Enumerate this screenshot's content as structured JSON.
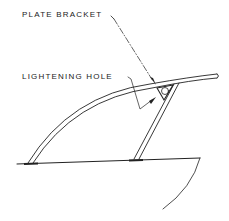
{
  "diagram": {
    "labels": {
      "plate_bracket": "PLATE BRACKET",
      "lightening_hole": "LIGHTENING HOLE"
    },
    "colors": {
      "ink": "#222222",
      "background": "#ffffff"
    },
    "parts": [
      "curved canopy tube",
      "vertical strut",
      "plate bracket",
      "lightening hole",
      "deck line",
      "hull curve"
    ]
  }
}
